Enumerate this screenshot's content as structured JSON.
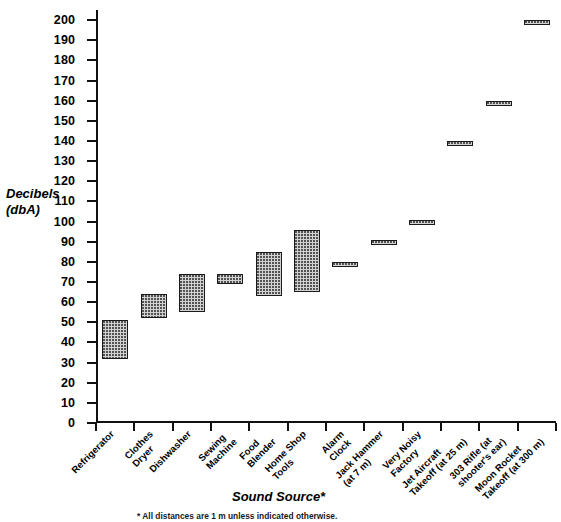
{
  "chart_data": {
    "type": "bar",
    "subtype": "floating-range-bar",
    "title": "",
    "xlabel": "Sound Source*",
    "ylabel": "Decibels\n(dbA)",
    "ylabel_line1": "Decibels",
    "ylabel_line2": "(dbA)",
    "ylim": [
      0,
      205
    ],
    "ytick_step": 10,
    "yticks": [
      0,
      10,
      20,
      30,
      40,
      50,
      60,
      70,
      80,
      90,
      100,
      110,
      120,
      130,
      140,
      150,
      160,
      170,
      180,
      190,
      200
    ],
    "grid": false,
    "legend": false,
    "units": "dbA",
    "categories": [
      "Refrigerator",
      "Clothes Dryer",
      "Dishwasher",
      "Sewing Machine",
      "Food Blender",
      "Home Shop Tools",
      "Alarm Clock",
      "Jack Hammer (at 7 m)",
      "Very Noisy Factory",
      "Jet Aircraft Takeoff (at 25 m)",
      "303 Rifle (at shooter's ear)",
      "Moon Rocket Takeoff (at 300 m)"
    ],
    "category_label_lines": [
      [
        "Refrigerator"
      ],
      [
        "Clothes",
        "Dryer"
      ],
      [
        "Dishwasher"
      ],
      [
        "Sewing",
        "Machine"
      ],
      [
        "Food",
        "Blender"
      ],
      [
        "Home Shop",
        "Tools"
      ],
      [
        "Alarm",
        "Clock"
      ],
      [
        "Jack Hammer",
        "(at 7 m)"
      ],
      [
        "Very Noisy",
        "Factory"
      ],
      [
        "Jet Aircraft",
        "Takeoff (at 25 m)"
      ],
      [
        "303 Rifle (at",
        "shooter's ear)"
      ],
      [
        "Moon Rocket",
        "Takeoff (at 300 m)"
      ]
    ],
    "ranges": [
      {
        "category": "Refrigerator",
        "low": 32,
        "high": 51
      },
      {
        "category": "Clothes Dryer",
        "low": 52,
        "high": 64
      },
      {
        "category": "Dishwasher",
        "low": 55,
        "high": 74
      },
      {
        "category": "Sewing Machine",
        "low": 69,
        "high": 74
      },
      {
        "category": "Food Blender",
        "low": 63,
        "high": 85
      },
      {
        "category": "Home Shop Tools",
        "low": 65,
        "high": 96
      },
      {
        "category": "Alarm Clock",
        "low": 78,
        "high": 80
      },
      {
        "category": "Jack Hammer (at 7 m)",
        "low": 89,
        "high": 91
      },
      {
        "category": "Very Noisy Factory",
        "low": 99,
        "high": 101
      },
      {
        "category": "Jet Aircraft Takeoff (at 25 m)",
        "low": 138,
        "high": 140
      },
      {
        "category": "303 Rifle (at shooter's ear)",
        "low": 158,
        "high": 160
      },
      {
        "category": "Moon Rocket Takeoff (at 300 m)",
        "low": 198,
        "high": 200
      }
    ],
    "lows": [
      32,
      52,
      55,
      69,
      63,
      65,
      78,
      89,
      99,
      138,
      158,
      198
    ],
    "highs": [
      51,
      64,
      74,
      74,
      85,
      96,
      80,
      91,
      101,
      140,
      160,
      200
    ],
    "footnote": "* All distances are 1 m unless indicated otherwise.",
    "colors": {
      "bar_fill": "#d2d2d2",
      "bar_border": "#1a1a1a",
      "axis": "#111111",
      "text": "#000000",
      "background": "#ffffff"
    }
  }
}
